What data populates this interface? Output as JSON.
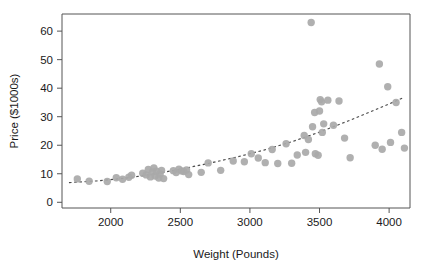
{
  "chart_data": {
    "type": "scatter",
    "title": "",
    "xlabel": "Weight (Pounds)",
    "ylabel": "Price ($1000s)",
    "xlim": [
      1650,
      4150
    ],
    "ylim": [
      -2,
      66
    ],
    "xticks": [
      2000,
      2500,
      3000,
      3500,
      4000
    ],
    "yticks": [
      0,
      10,
      20,
      30,
      40,
      50,
      60
    ],
    "xtick_labels": [
      "2000",
      "2500",
      "3000",
      "3500",
      "4000"
    ],
    "ytick_labels": [
      "0",
      "10",
      "20",
      "30",
      "40",
      "50",
      "60"
    ],
    "grid": false,
    "legend": null,
    "point_color": "#a9a9a9",
    "trend_color": "#4a4a4a",
    "frame_color": "#555555",
    "series": [
      {
        "name": "Cars",
        "marker": "circle",
        "points": [
          [
            1760,
            8.2
          ],
          [
            1845,
            7.4
          ],
          [
            1975,
            7.3
          ],
          [
            2040,
            8.6
          ],
          [
            2085,
            8.1
          ],
          [
            2130,
            8.8
          ],
          [
            2150,
            9.5
          ],
          [
            2230,
            10.2
          ],
          [
            2255,
            9.6
          ],
          [
            2270,
            11.5
          ],
          [
            2285,
            8.9
          ],
          [
            2300,
            10.6
          ],
          [
            2310,
            12.0
          ],
          [
            2320,
            9.2
          ],
          [
            2330,
            10.9
          ],
          [
            2345,
            8.5
          ],
          [
            2355,
            9.9
          ],
          [
            2365,
            11.2
          ],
          [
            2380,
            8.3
          ],
          [
            2450,
            11.1
          ],
          [
            2470,
            10.4
          ],
          [
            2490,
            11.6
          ],
          [
            2510,
            11.0
          ],
          [
            2525,
            10.8
          ],
          [
            2545,
            11.3
          ],
          [
            2560,
            9.7
          ],
          [
            2650,
            10.5
          ],
          [
            2700,
            13.8
          ],
          [
            2790,
            11.2
          ],
          [
            2880,
            14.5
          ],
          [
            2960,
            14.2
          ],
          [
            3010,
            17.0
          ],
          [
            3060,
            15.5
          ],
          [
            3110,
            13.9
          ],
          [
            3160,
            18.5
          ],
          [
            3200,
            13.6
          ],
          [
            3260,
            20.5
          ],
          [
            3300,
            13.7
          ],
          [
            3340,
            16.6
          ],
          [
            3390,
            23.4
          ],
          [
            3400,
            17.5
          ],
          [
            3420,
            22.0
          ],
          [
            3440,
            63.0
          ],
          [
            3450,
            26.5
          ],
          [
            3465,
            31.5
          ],
          [
            3470,
            17.0
          ],
          [
            3490,
            16.5
          ],
          [
            3500,
            32.0
          ],
          [
            3505,
            36.0
          ],
          [
            3515,
            35.2
          ],
          [
            3520,
            24.5
          ],
          [
            3530,
            27.5
          ],
          [
            3560,
            35.8
          ],
          [
            3600,
            27.0
          ],
          [
            3640,
            35.5
          ],
          [
            3680,
            22.5
          ],
          [
            3720,
            15.6
          ],
          [
            3900,
            20.0
          ],
          [
            3930,
            48.5
          ],
          [
            3950,
            18.6
          ],
          [
            3990,
            40.5
          ],
          [
            4010,
            21.0
          ],
          [
            4050,
            35.0
          ],
          [
            4090,
            24.5
          ],
          [
            4110,
            19.0
          ]
        ]
      }
    ],
    "trend": {
      "style": "dashed",
      "description": "fitted curve, increasing",
      "points": [
        [
          1700,
          6.9
        ],
        [
          1900,
          7.5
        ],
        [
          2100,
          8.4
        ],
        [
          2300,
          9.8
        ],
        [
          2500,
          11.6
        ],
        [
          2700,
          13.6
        ],
        [
          2900,
          15.8
        ],
        [
          3100,
          18.3
        ],
        [
          3300,
          21.2
        ],
        [
          3500,
          24.6
        ],
        [
          3700,
          28.4
        ],
        [
          3900,
          32.4
        ],
        [
          4100,
          36.6
        ]
      ]
    }
  }
}
